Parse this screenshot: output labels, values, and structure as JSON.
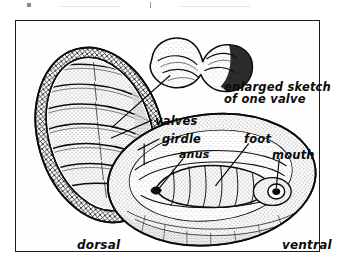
{
  "figure": {
    "frame_color": "#1a1a1a",
    "background_color": "#ffffff",
    "ink_color": "#111111",
    "views": [
      {
        "id": "dorsal",
        "caption": "dorsal"
      },
      {
        "id": "ventral",
        "caption": "ventral"
      },
      {
        "id": "valve",
        "caption": "enlarged sketch of one valve"
      }
    ],
    "callouts": [
      {
        "id": "valves",
        "label": "valves",
        "target_view": "dorsal"
      },
      {
        "id": "girdle",
        "label": "girdle",
        "target_view": "dorsal"
      },
      {
        "id": "anus",
        "label": "anus",
        "target_view": "ventral"
      },
      {
        "id": "foot",
        "label": "foot",
        "target_view": "ventral"
      },
      {
        "id": "mouth",
        "label": "mouth",
        "target_view": "ventral"
      }
    ],
    "enlarged_caption_line1": "enlarged sketch",
    "enlarged_caption_line2": "of one valve",
    "dorsal_caption": "dorsal",
    "ventral_caption": "ventral",
    "valve_count": 8
  }
}
